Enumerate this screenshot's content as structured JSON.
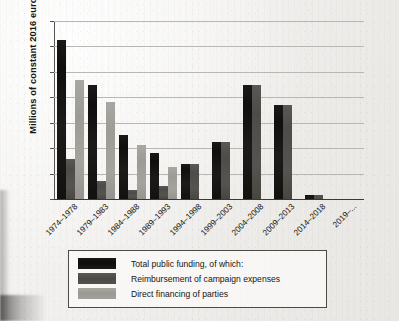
{
  "chart_data": {
    "type": "bar",
    "title": "",
    "xlabel": "",
    "ylabel": "Millions of constant 2016 euros",
    "ylim": [
      0,
      350
    ],
    "ytick_step": 50,
    "yticks": [
      "350",
      "300",
      "250",
      "200",
      "150",
      "100",
      "50",
      "0"
    ],
    "grid": true,
    "legend_position": "below-plot",
    "categories": [
      "1974–1978",
      "1979–1983",
      "1984–1988",
      "1989–1993",
      "1994–1998",
      "1999–2003",
      "2004–2008",
      "2009–2013",
      "2014–2018",
      "2019–..."
    ],
    "series": [
      {
        "name": "Total public funding, of which:",
        "color": "#141312",
        "values": [
          313,
          225,
          126,
          90,
          69,
          112,
          225,
          185,
          8,
          0
        ]
      },
      {
        "name": "Reimbursement of campaign expenses",
        "color": "#4f4d49",
        "values": [
          78,
          35,
          18,
          25,
          69,
          112,
          225,
          185,
          8,
          0
        ]
      },
      {
        "name": "Direct financing of parties",
        "color": "#a09e99",
        "values": [
          235,
          190,
          107,
          62,
          0,
          0,
          0,
          0,
          0,
          0
        ]
      }
    ]
  },
  "legend": {
    "items": [
      {
        "label": "Total public funding, of which:",
        "swatch": "legend-swatch-total"
      },
      {
        "label": "Reimbursement of campaign expenses",
        "swatch": "legend-swatch-reimbursement"
      },
      {
        "label": "Direct financing of parties",
        "swatch": "legend-swatch-direct"
      }
    ]
  }
}
